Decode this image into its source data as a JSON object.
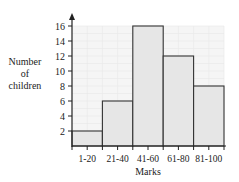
{
  "chart_data": {
    "type": "bar",
    "title": "",
    "xlabel": "Marks",
    "ylabel": "Number of children",
    "ylabel_lines": [
      "Number",
      "of",
      "children"
    ],
    "categories": [
      "1-20",
      "21-40",
      "41-60",
      "61-80",
      "81-100"
    ],
    "values": [
      2,
      6,
      16,
      12,
      8
    ],
    "ylim": [
      0,
      16
    ],
    "yticks": [
      2,
      4,
      6,
      8,
      10,
      12,
      14,
      16
    ],
    "grid": true,
    "legend": null,
    "histogram": true
  },
  "colors": {
    "bar_fill": "#e6e6e6",
    "bar_stroke": "#333333",
    "grid_bg": "#f5f5f5",
    "grid_line": "#e8e8e8",
    "axis": "#222222"
  }
}
